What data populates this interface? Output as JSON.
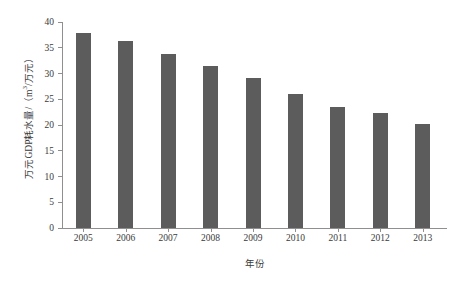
{
  "chart_data": {
    "type": "bar",
    "title": "",
    "categories": [
      "2005",
      "2006",
      "2007",
      "2008",
      "2009",
      "2010",
      "2011",
      "2012",
      "2013"
    ],
    "values": [
      37.8,
      36.3,
      33.8,
      31.4,
      29.2,
      26.1,
      23.5,
      22.4,
      20.2
    ],
    "xlabel": "年份",
    "ylabel": "万元GDP耗水量/（m³/万元）",
    "ylabel_parts": {
      "prefix": "万元GDP耗水量/（m",
      "exponent": "3",
      "suffix": "/万元）"
    },
    "ylim": [
      0,
      40
    ],
    "yticks": [
      "0",
      "5",
      "10",
      "15",
      "20",
      "25",
      "30",
      "35",
      "40"
    ],
    "ytick_values": [
      0,
      5,
      10,
      15,
      20,
      25,
      30,
      35,
      40
    ],
    "grid": false,
    "legend": null,
    "series_color": "#5c5c5c",
    "axis_color": "#8f8f8f",
    "text_color": "#3a3a3a",
    "background": "#ffffff"
  }
}
